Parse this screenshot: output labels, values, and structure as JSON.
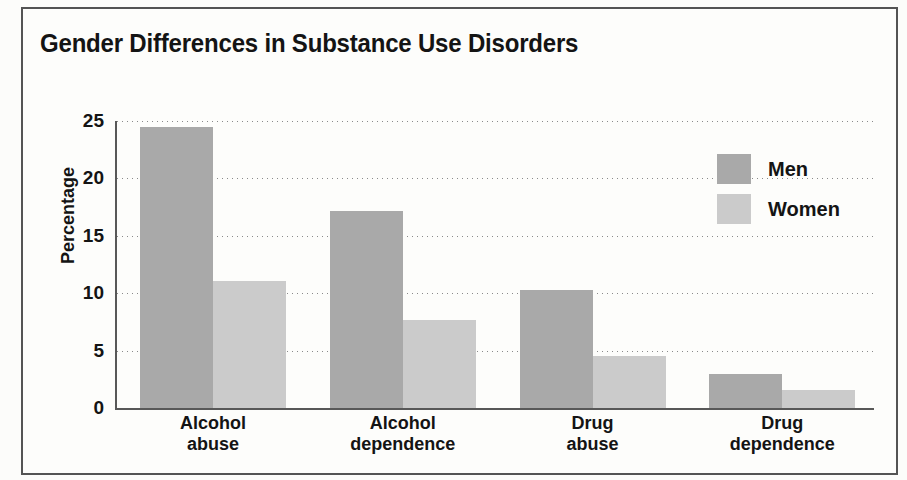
{
  "figure": {
    "title": "Gender Differences in Substance Use Disorders",
    "frame_color": "#545454",
    "background_color": "#fdfdfb"
  },
  "legend": {
    "position": "top-right-inside",
    "entries": [
      {
        "label": "Men",
        "color": "#a9a9a9",
        "swatch_name": "legend-swatch-men"
      },
      {
        "label": "Women",
        "color": "#cbcbcb",
        "swatch_name": "legend-swatch-women"
      }
    ]
  },
  "axes": {
    "ylabel": "Percentage",
    "ytick_labels": [
      "25",
      "20",
      "15",
      "10",
      "5",
      "0"
    ],
    "xtick_labels": [
      "Alcohol\nabuse",
      "Alcohol\ndependence",
      "Drug\nabuse",
      "Drug\ndependence"
    ]
  },
  "chart_data": {
    "type": "bar",
    "title": "Gender Differences in Substance Use Disorders",
    "xlabel": "",
    "ylabel": "Percentage",
    "categories": [
      "Alcohol abuse",
      "Alcohol dependence",
      "Drug abuse",
      "Drug dependence"
    ],
    "series": [
      {
        "name": "Men",
        "color": "#a9a9a9",
        "values": [
          24.5,
          17.2,
          10.3,
          3.0
        ]
      },
      {
        "name": "Women",
        "color": "#cbcbcb",
        "values": [
          11.1,
          7.7,
          4.5,
          1.6
        ]
      }
    ],
    "ylim": [
      0,
      25
    ],
    "ytick_values": [
      0,
      5,
      10,
      15,
      20,
      25
    ],
    "grid": "horizontal-dotted",
    "legend": "inside top right",
    "bar_orientation": "vertical",
    "grouping": "grouped-adjacent"
  },
  "background_bleed": [
    {
      "text": "personal problems",
      "x": 560,
      "y": 70,
      "size": 21
    },
    {
      "text": "may vary",
      "x": 405,
      "y": 105,
      "size": 21
    },
    {
      "text": "Although for",
      "x": 470,
      "y": 150,
      "size": 24
    },
    {
      "text": "and  the",
      "x": 430,
      "y": 195,
      "size": 24
    },
    {
      "text": "begins in such",
      "x": 470,
      "y": 240,
      "size": 26
    },
    {
      "text": "tion of",
      "x": 420,
      "y": 285,
      "size": 24
    },
    {
      "text": "use that",
      "x": 520,
      "y": 330,
      "size": 24
    },
    {
      "text": "they",
      "x": 640,
      "y": 375,
      "size": 24
    }
  ]
}
